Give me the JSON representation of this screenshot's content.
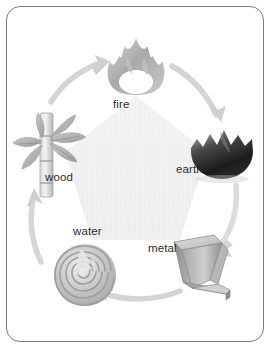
{
  "diagram": {
    "type": "cycle-diagram",
    "frame": {
      "border_color": "#7b7b7b",
      "background": "#ffffff",
      "corner_radius": "14"
    },
    "palette": {
      "pentagon_fill": "#f2f2f2",
      "pentagon_stripe": "#ededed",
      "arrow_fill": "#d6d6d6",
      "arrow_edge": "#c4c4c4",
      "label_color": "#2b2b2b",
      "fire_color": "#b5b5b5",
      "earth_color": "#2a2a2a",
      "metal_color": "#9a9a9a",
      "water_color": "#bdbdbd",
      "wood_color": "#b0b0b0"
    },
    "nodes": [
      {
        "id": "fire",
        "label": "fire",
        "icon": "flame-icon",
        "position": "top",
        "label_x": 113,
        "label_y": 99
      },
      {
        "id": "earth",
        "label": "earth",
        "icon": "mountain-icon",
        "position": "upper-right",
        "label_x": 176,
        "label_y": 164
      },
      {
        "id": "metal",
        "label": "metal",
        "icon": "folded-metal-sheet-icon",
        "position": "lower-right",
        "label_x": 148,
        "label_y": 243
      },
      {
        "id": "water",
        "label": "water",
        "icon": "whirlpool-spiral-icon",
        "position": "lower-left",
        "label_x": 73,
        "label_y": 226
      },
      {
        "id": "wood",
        "label": "wood",
        "icon": "bamboo-icon",
        "position": "upper-left",
        "label_x": 45,
        "label_y": 172
      }
    ],
    "arrows": [
      {
        "id": "wood-to-fire",
        "from": "wood",
        "to": "fire",
        "name": "arrow-wood-to-fire"
      },
      {
        "id": "fire-to-earth",
        "from": "fire",
        "to": "earth",
        "name": "arrow-fire-to-earth"
      },
      {
        "id": "earth-to-metal",
        "from": "earth",
        "to": "metal",
        "name": "arrow-earth-to-metal"
      },
      {
        "id": "metal-to-water",
        "from": "metal",
        "to": "water",
        "name": "arrow-metal-to-water"
      },
      {
        "id": "water-to-wood",
        "from": "water",
        "to": "wood",
        "name": "arrow-water-to-wood"
      }
    ]
  }
}
